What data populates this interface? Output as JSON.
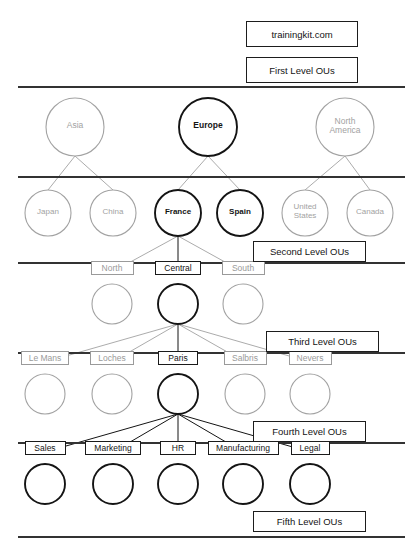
{
  "meta": {
    "colors": {
      "ink": "#141414",
      "gray": "#a2a2a2",
      "divider": "#333333",
      "page_bg": "#ffffff"
    }
  },
  "legend_boxes": [
    {
      "id": "domain",
      "label": "trainingkit.com",
      "x": 246,
      "y": 21,
      "w": 112,
      "h": 26
    },
    {
      "id": "level1",
      "label": "First Level OUs",
      "x": 246,
      "y": 57,
      "w": 112,
      "h": 26
    },
    {
      "id": "level2",
      "label": "Second Level OUs",
      "x": 253,
      "y": 241,
      "w": 113,
      "h": 21
    },
    {
      "id": "level3",
      "label": "Third Level OUs",
      "x": 266,
      "y": 331,
      "w": 113,
      "h": 21
    },
    {
      "id": "level4",
      "label": "Fourth Level OUs",
      "x": 253,
      "y": 421,
      "w": 113,
      "h": 21
    },
    {
      "id": "level5",
      "label": "Fifth Level OUs",
      "x": 253,
      "y": 511,
      "w": 113,
      "h": 21
    }
  ],
  "dividers": [
    {
      "id": "divider-1",
      "x1": 18,
      "y1": 87,
      "x2": 405,
      "y2": 87
    },
    {
      "id": "divider-2",
      "x1": 18,
      "y1": 177,
      "x2": 405,
      "y2": 177
    },
    {
      "id": "divider-3",
      "x1": 18,
      "y1": 263,
      "x2": 405,
      "y2": 263
    },
    {
      "id": "divider-4",
      "x1": 18,
      "y1": 353,
      "x2": 405,
      "y2": 353
    },
    {
      "id": "divider-5",
      "x1": 18,
      "y1": 443,
      "x2": 405,
      "y2": 443
    },
    {
      "id": "divider-6",
      "x1": 18,
      "y1": 537,
      "x2": 405,
      "y2": 537
    }
  ],
  "levels": [
    {
      "id": "level-1",
      "name": "First Level OUs",
      "label_style": "inside",
      "radius": 29,
      "cy": 127,
      "nodes": [
        {
          "id": "asia",
          "label": "Asia",
          "cx": 75,
          "highlighted": false
        },
        {
          "id": "europe",
          "label": "Europe",
          "cx": 208,
          "highlighted": true
        },
        {
          "id": "north-america",
          "label": "North\nAmerica",
          "cx": 345,
          "highlighted": false
        }
      ]
    },
    {
      "id": "level-2",
      "name": "Second Level OUs",
      "label_style": "inside",
      "radius": 23,
      "cy": 213,
      "nodes": [
        {
          "id": "japan",
          "label": "Japan",
          "cx": 48,
          "highlighted": false
        },
        {
          "id": "china",
          "label": "China",
          "cx": 113,
          "highlighted": false
        },
        {
          "id": "france",
          "label": "France",
          "cx": 178,
          "highlighted": true
        },
        {
          "id": "spain",
          "label": "Spain",
          "cx": 240,
          "highlighted": true
        },
        {
          "id": "united-states",
          "label": "United\nStates",
          "cx": 305,
          "highlighted": false
        },
        {
          "id": "canada",
          "label": "Canada",
          "cx": 370,
          "highlighted": false
        }
      ]
    },
    {
      "id": "level-3",
      "name": "Third Level OUs",
      "label_style": "boxed-above",
      "radius": 20,
      "cy": 304,
      "box_y": 272,
      "nodes": [
        {
          "id": "north",
          "label": "North",
          "cx": 112,
          "highlighted": false,
          "box_w": 43
        },
        {
          "id": "central",
          "label": "Central",
          "cx": 178,
          "highlighted": true,
          "box_w": 46
        },
        {
          "id": "south",
          "label": "South",
          "cx": 243,
          "highlighted": false,
          "box_w": 43
        }
      ]
    },
    {
      "id": "level-4",
      "name": "Fourth Level OUs",
      "label_style": "boxed-above",
      "radius": 20,
      "cy": 394,
      "box_y": 362,
      "nodes": [
        {
          "id": "le-mans",
          "label": "Le Mans",
          "cx": 45,
          "highlighted": false,
          "box_w": 48
        },
        {
          "id": "loches",
          "label": "Loches",
          "cx": 112,
          "highlighted": false,
          "box_w": 44
        },
        {
          "id": "paris",
          "label": "Paris",
          "cx": 178,
          "highlighted": true,
          "box_w": 40
        },
        {
          "id": "salbris",
          "label": "Salbris",
          "cx": 245,
          "highlighted": false,
          "box_w": 43
        },
        {
          "id": "nevers",
          "label": "Nevers",
          "cx": 310,
          "highlighted": false,
          "box_w": 43
        }
      ]
    },
    {
      "id": "level-5",
      "name": "Fifth Level OUs",
      "label_style": "boxed-above",
      "radius": 20,
      "cy": 484,
      "box_y": 452,
      "nodes": [
        {
          "id": "sales",
          "label": "Sales",
          "cx": 45,
          "highlighted": true,
          "box_w": 41
        },
        {
          "id": "marketing",
          "label": "Marketing",
          "cx": 113,
          "highlighted": true,
          "box_w": 56
        },
        {
          "id": "hr",
          "label": "HR",
          "cx": 178,
          "highlighted": true,
          "box_w": 36
        },
        {
          "id": "manufacturing",
          "label": "Manufacturing",
          "cx": 243,
          "highlighted": true,
          "box_w": 71
        },
        {
          "id": "legal",
          "label": "Legal",
          "cx": 310,
          "highlighted": true,
          "box_w": 39
        }
      ]
    }
  ],
  "connections": [
    {
      "from": "asia",
      "to": "japan",
      "style": "gray"
    },
    {
      "from": "asia",
      "to": "china",
      "style": "gray"
    },
    {
      "from": "europe",
      "to": "france",
      "style": "gray"
    },
    {
      "from": "europe",
      "to": "spain",
      "style": "gray"
    },
    {
      "from": "north-america",
      "to": "united-states",
      "style": "gray"
    },
    {
      "from": "north-america",
      "to": "canada",
      "style": "gray"
    },
    {
      "from": "france",
      "to": "north",
      "style": "gray"
    },
    {
      "from": "france",
      "to": "central",
      "style": "dark"
    },
    {
      "from": "france",
      "to": "south",
      "style": "gray"
    },
    {
      "from": "central",
      "to": "le-mans",
      "style": "gray"
    },
    {
      "from": "central",
      "to": "loches",
      "style": "gray"
    },
    {
      "from": "central",
      "to": "paris",
      "style": "dark"
    },
    {
      "from": "central",
      "to": "salbris",
      "style": "gray"
    },
    {
      "from": "central",
      "to": "nevers",
      "style": "gray"
    },
    {
      "from": "paris",
      "to": "sales",
      "style": "dark"
    },
    {
      "from": "paris",
      "to": "marketing",
      "style": "dark"
    },
    {
      "from": "paris",
      "to": "hr",
      "style": "dark"
    },
    {
      "from": "paris",
      "to": "manufacturing",
      "style": "dark"
    },
    {
      "from": "paris",
      "to": "legal",
      "style": "dark"
    }
  ]
}
